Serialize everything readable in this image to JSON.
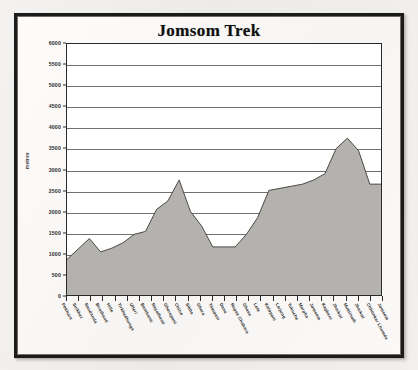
{
  "frame": {
    "style_name": "thick-black-picture-frame"
  },
  "chart_data": {
    "type": "area",
    "title": "Jomsom Trek",
    "xlabel": "",
    "ylabel": "metres",
    "ylim": [
      0,
      6000
    ],
    "ytick_step": 500,
    "yticks": [
      0,
      500,
      1000,
      1500,
      2000,
      2500,
      3000,
      3500,
      4000,
      4500,
      5000,
      5500,
      6000
    ],
    "ytick_labels": [
      "0",
      "500",
      "1000",
      "1500",
      "2000",
      "2500",
      "3000",
      "3500",
      "4000",
      "4500",
      "5000",
      "5500",
      "6000"
    ],
    "grid": true,
    "grid_axis": "y",
    "legend": false,
    "legend_position": "none",
    "fill_color": "#b4b2ae",
    "line_color": "#4a4845",
    "plot_bg": "#ffffff",
    "categories": [
      "Pokhara",
      "Suikhet",
      "Naudanda",
      "Birethanti",
      "Hille",
      "Tirkhedhunga",
      "Ulleri",
      "Banthanti",
      "Nayathanti",
      "Ghorepani",
      "Chitre",
      "Sikha",
      "Ghara",
      "Tatopani",
      "Dana",
      "Rupse Chahara",
      "Ghasa",
      "Lete",
      "Kalopani",
      "Larjung",
      "Tukuche",
      "Marpha",
      "Jomsom",
      "Kagbeni",
      "Jharkot",
      "Muktinath",
      "Jharkot",
      "Chhonkar Lhumda",
      "Jomsom"
    ],
    "values": [
      850,
      1100,
      1350,
      1030,
      1120,
      1250,
      1450,
      1520,
      2050,
      2250,
      2750,
      2000,
      1650,
      1150,
      1150,
      1150,
      1450,
      1850,
      2500,
      2550,
      2600,
      2650,
      2750,
      2900,
      3500,
      3750,
      3450,
      2650,
      2650
    ],
    "values_unit": "metres",
    "x_tick_count": 27
  }
}
